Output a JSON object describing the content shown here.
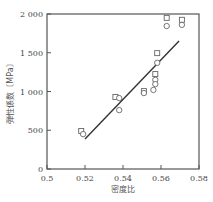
{
  "chart_data": {
    "type": "scatter",
    "title": "",
    "xlabel": "密度比",
    "ylabel": "弾性係数〔MPa〕",
    "xlim": [
      0.5,
      0.58
    ],
    "ylim": [
      0,
      2000
    ],
    "xticks": [
      0.5,
      0.52,
      0.54,
      0.56,
      0.58
    ],
    "xtick_labels": [
      "0.5",
      "0.52",
      "0.54",
      "0.56",
      "0.58"
    ],
    "yticks": [
      0,
      500,
      1000,
      1500,
      2000
    ],
    "ytick_labels": [
      "0",
      "500",
      "1 000",
      "1 500",
      "2 000"
    ],
    "grid": false,
    "legend": null,
    "series": [
      {
        "name": "square",
        "marker": "square",
        "points": [
          {
            "x": 0.518,
            "y": 490
          },
          {
            "x": 0.536,
            "y": 930
          },
          {
            "x": 0.551,
            "y": 1005
          },
          {
            "x": 0.557,
            "y": 1225
          },
          {
            "x": 0.558,
            "y": 1495
          },
          {
            "x": 0.563,
            "y": 1950
          },
          {
            "x": 0.571,
            "y": 1925
          }
        ]
      },
      {
        "name": "circle",
        "marker": "circle",
        "points": [
          {
            "x": 0.519,
            "y": 450
          },
          {
            "x": 0.538,
            "y": 915
          },
          {
            "x": 0.538,
            "y": 760
          },
          {
            "x": 0.551,
            "y": 980
          },
          {
            "x": 0.556,
            "y": 1020
          },
          {
            "x": 0.557,
            "y": 1150
          },
          {
            "x": 0.557,
            "y": 1095
          },
          {
            "x": 0.558,
            "y": 1370
          },
          {
            "x": 0.563,
            "y": 1845
          },
          {
            "x": 0.571,
            "y": 1860
          }
        ]
      }
    ],
    "fit_line": {
      "type": "line",
      "from": {
        "x": 0.52,
        "y": 387
      },
      "to": {
        "x": 0.5695,
        "y": 1652
      }
    }
  },
  "layout": {
    "plot_left": 47,
    "plot_right": 199,
    "plot_top": 14,
    "plot_bottom": 169,
    "colors": {
      "axis": "#555555",
      "marker": "#666666",
      "line": "#333333"
    }
  }
}
